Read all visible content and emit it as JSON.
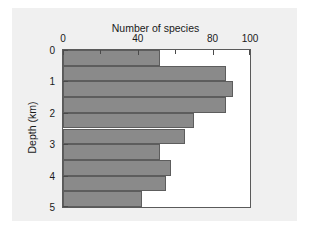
{
  "chart_data": {
    "type": "bar",
    "orientation": "horizontal",
    "title": "",
    "xlabel": "Number of species",
    "ylabel": "Depth (km)",
    "xlim": [
      0,
      100
    ],
    "ylim": [
      0,
      5
    ],
    "y_inverted": true,
    "grid": false,
    "legend": null,
    "xticks": [
      0,
      20,
      40,
      60,
      80,
      100
    ],
    "xtick_labels": [
      "0",
      "",
      "40",
      "",
      "80",
      "100"
    ],
    "yticks": [
      0,
      1,
      2,
      3,
      4,
      5
    ],
    "ytick_labels": [
      "0",
      "1",
      "2",
      "3",
      "4",
      "5"
    ],
    "bin_width_km": 0.5,
    "categories": [
      "0.0-0.5",
      "0.5-1.0",
      "1.0-1.5",
      "1.5-2.0",
      "2.0-2.5",
      "2.5-3.0",
      "3.0-3.5",
      "3.5-4.0",
      "4.0-4.5",
      "4.5-5.0"
    ],
    "bin_starts_km": [
      0.0,
      0.5,
      1.0,
      1.5,
      2.0,
      2.5,
      3.0,
      3.5,
      4.0,
      4.5
    ],
    "values": [
      52,
      87,
      91,
      87,
      70,
      65,
      52,
      58,
      55,
      42
    ],
    "bar_color": "#8a8a8a",
    "bar_edge_color": "#5d5d5d",
    "axes_color": "#5a5a5a",
    "figure_background": "#f0f0f0",
    "plot_background": "#ffffff"
  }
}
